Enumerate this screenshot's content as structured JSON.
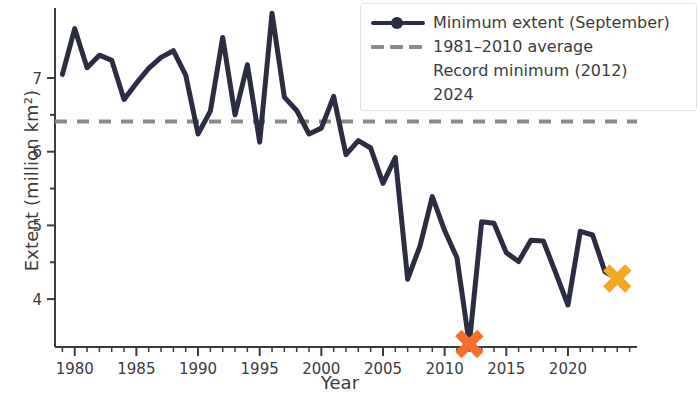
{
  "chart_data": {
    "type": "line",
    "title": "",
    "xlabel": "Year",
    "ylabel": "Extent (million km²)",
    "xlim": [
      1978.4,
      2025.6
    ],
    "ylim": [
      3.35,
      7.95
    ],
    "xticks": [
      1980,
      1985,
      1990,
      1995,
      2000,
      2005,
      2010,
      2015,
      2020
    ],
    "xtick_labels": [
      "1980",
      "1985",
      "1990",
      "1995",
      "2000",
      "2005",
      "2010",
      "2015",
      "2020"
    ],
    "xminor_step": 1,
    "yticks": [
      4,
      5,
      6,
      7
    ],
    "ytick_labels": [
      "4",
      "5",
      "6",
      "7"
    ],
    "yminor_ticks": [
      4.5,
      5.5,
      6.5
    ],
    "grid": false,
    "legend_position": "upper right",
    "series": [
      {
        "name": "Minimum extent (September)",
        "type": "line",
        "color": "#2b2d42",
        "x": [
          1979,
          1980,
          1981,
          1982,
          1983,
          1984,
          1985,
          1986,
          1987,
          1988,
          1989,
          1990,
          1991,
          1992,
          1993,
          1994,
          1995,
          1996,
          1997,
          1998,
          1999,
          2000,
          2001,
          2002,
          2003,
          2004,
          2005,
          2006,
          2007,
          2008,
          2009,
          2010,
          2011,
          2012,
          2013,
          2014,
          2015,
          2016,
          2017,
          2018,
          2019,
          2020,
          2021,
          2022,
          2023,
          2024
        ],
        "values": [
          7.05,
          7.67,
          7.14,
          7.31,
          7.24,
          6.71,
          6.93,
          7.13,
          7.28,
          7.37,
          7.04,
          6.24,
          6.55,
          7.55,
          6.5,
          7.18,
          6.13,
          7.88,
          6.74,
          6.56,
          6.24,
          6.32,
          6.75,
          5.96,
          6.15,
          6.05,
          5.57,
          5.92,
          4.27,
          4.72,
          5.39,
          4.93,
          4.56,
          3.39,
          5.05,
          5.03,
          4.63,
          4.51,
          4.8,
          4.79,
          4.36,
          3.92,
          4.92,
          4.87,
          4.37,
          4.28
        ]
      }
    ],
    "reference_line": {
      "name": "1981–2010 average",
      "value": 6.41,
      "color": "#8a8a8a",
      "style": "dashed"
    },
    "markers": [
      {
        "name": "Record minimum (2012)",
        "marker": "X",
        "color": "#f4702a",
        "x": 2012,
        "y": 3.39
      },
      {
        "name": "2024",
        "marker": "X",
        "color": "#f5a623",
        "x": 2024,
        "y": 4.28
      }
    ]
  },
  "legend": {
    "entries": [
      {
        "label": "Minimum extent (September)",
        "key": "line-marker",
        "color": "#2b2d42"
      },
      {
        "label": "1981–2010 average",
        "key": "dashed-line",
        "color": "#8a8a8a"
      },
      {
        "label": "Record minimum (2012)",
        "key": "x-marker",
        "color": "#f4702a"
      },
      {
        "label": "2024",
        "key": "x-marker",
        "color": "#f5a623"
      }
    ]
  },
  "axes": {
    "xlabel": "Year",
    "ylabel": "Extent (million km²)"
  }
}
